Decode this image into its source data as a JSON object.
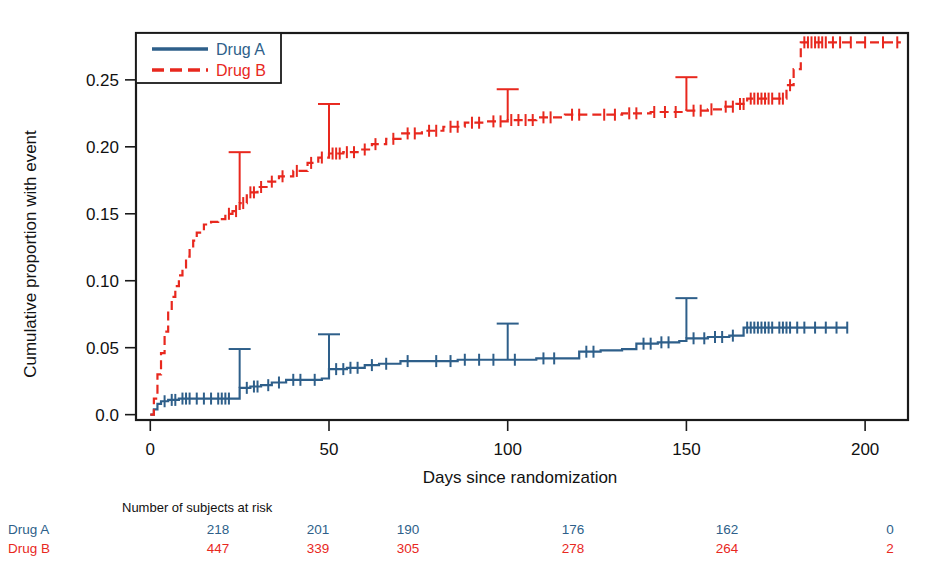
{
  "chart_data": {
    "type": "line",
    "title": "",
    "xlabel": "Days since randomization",
    "ylabel": "Cumulative proportion with event",
    "xlim": [
      -4,
      212
    ],
    "ylim": [
      -0.004,
      0.285
    ],
    "xticks": [
      0,
      50,
      100,
      150,
      200
    ],
    "xticklabels": [
      "0",
      "50",
      "100",
      "150",
      "200"
    ],
    "yticks": [
      0.0,
      0.05,
      0.1,
      0.15,
      0.2,
      0.25
    ],
    "yticklabels": [
      "0.0",
      "0.05",
      "0.10",
      "0.15",
      "0.20",
      "0.25"
    ],
    "grid": false,
    "legend_position": "top-left",
    "series": [
      {
        "name": "Drug A",
        "color": "#2e5f8a",
        "dash": "solid",
        "points": [
          [
            0,
            0.0
          ],
          [
            1,
            0.004
          ],
          [
            2,
            0.008
          ],
          [
            3,
            0.01
          ],
          [
            5,
            0.011
          ],
          [
            8,
            0.012
          ],
          [
            12,
            0.012
          ],
          [
            18,
            0.012
          ],
          [
            23,
            0.012
          ],
          [
            25,
            0.02
          ],
          [
            28,
            0.021
          ],
          [
            31,
            0.022
          ],
          [
            34,
            0.024
          ],
          [
            38,
            0.026
          ],
          [
            44,
            0.026
          ],
          [
            48,
            0.027
          ],
          [
            50,
            0.034
          ],
          [
            55,
            0.035
          ],
          [
            60,
            0.037
          ],
          [
            64,
            0.038
          ],
          [
            70,
            0.04
          ],
          [
            78,
            0.04
          ],
          [
            86,
            0.041
          ],
          [
            94,
            0.041
          ],
          [
            100,
            0.041
          ],
          [
            108,
            0.042
          ],
          [
            116,
            0.042
          ],
          [
            120,
            0.047
          ],
          [
            126,
            0.048
          ],
          [
            132,
            0.049
          ],
          [
            136,
            0.053
          ],
          [
            142,
            0.054
          ],
          [
            148,
            0.055
          ],
          [
            150,
            0.057
          ],
          [
            156,
            0.058
          ],
          [
            162,
            0.059
          ],
          [
            166,
            0.065
          ],
          [
            175,
            0.065
          ],
          [
            185,
            0.065
          ],
          [
            195,
            0.065
          ]
        ],
        "censor_times": [
          4,
          6,
          7,
          9,
          10,
          11,
          13,
          15,
          17,
          19,
          20,
          21,
          22,
          27,
          29,
          30,
          33,
          36,
          40,
          42,
          46,
          52,
          54,
          56,
          58,
          62,
          66,
          72,
          80,
          84,
          88,
          92,
          96,
          102,
          110,
          113,
          122,
          124,
          138,
          140,
          143,
          145,
          152,
          155,
          158,
          160,
          163,
          167,
          168,
          169,
          170,
          171,
          172,
          173,
          174,
          176,
          177,
          178,
          179,
          181,
          183,
          186,
          189,
          192,
          195
        ],
        "error_bars": [
          {
            "x": 25,
            "y": 0.02,
            "upper": 0.049
          },
          {
            "x": 50,
            "y": 0.034,
            "upper": 0.06
          },
          {
            "x": 100,
            "y": 0.041,
            "upper": 0.068
          },
          {
            "x": 150,
            "y": 0.057,
            "upper": 0.087
          }
        ]
      },
      {
        "name": "Drug B",
        "color": "#e8281e",
        "dash": "dashed",
        "points": [
          [
            0,
            0.0
          ],
          [
            1,
            0.012
          ],
          [
            2,
            0.03
          ],
          [
            3,
            0.046
          ],
          [
            4,
            0.062
          ],
          [
            5,
            0.078
          ],
          [
            6,
            0.088
          ],
          [
            7,
            0.096
          ],
          [
            8,
            0.104
          ],
          [
            9,
            0.11
          ],
          [
            10,
            0.118
          ],
          [
            11,
            0.124
          ],
          [
            12,
            0.13
          ],
          [
            13,
            0.136
          ],
          [
            15,
            0.142
          ],
          [
            17,
            0.144
          ],
          [
            19,
            0.146
          ],
          [
            21,
            0.15
          ],
          [
            23,
            0.152
          ],
          [
            25,
            0.158
          ],
          [
            27,
            0.166
          ],
          [
            30,
            0.17
          ],
          [
            33,
            0.174
          ],
          [
            36,
            0.178
          ],
          [
            40,
            0.182
          ],
          [
            44,
            0.188
          ],
          [
            47,
            0.192
          ],
          [
            50,
            0.195
          ],
          [
            54,
            0.196
          ],
          [
            58,
            0.198
          ],
          [
            62,
            0.202
          ],
          [
            66,
            0.206
          ],
          [
            70,
            0.21
          ],
          [
            76,
            0.212
          ],
          [
            82,
            0.215
          ],
          [
            88,
            0.218
          ],
          [
            94,
            0.219
          ],
          [
            100,
            0.22
          ],
          [
            108,
            0.222
          ],
          [
            116,
            0.224
          ],
          [
            124,
            0.224
          ],
          [
            132,
            0.225
          ],
          [
            140,
            0.226
          ],
          [
            150,
            0.227
          ],
          [
            156,
            0.228
          ],
          [
            160,
            0.23
          ],
          [
            164,
            0.232
          ],
          [
            167,
            0.236
          ],
          [
            175,
            0.236
          ],
          [
            178,
            0.246
          ],
          [
            180,
            0.258
          ],
          [
            182,
            0.278
          ],
          [
            190,
            0.278
          ],
          [
            200,
            0.278
          ],
          [
            210,
            0.278
          ]
        ],
        "censor_times": [
          22,
          24,
          26,
          28,
          29,
          31,
          34,
          37,
          41,
          45,
          48,
          51,
          52,
          53,
          55,
          57,
          60,
          63,
          68,
          72,
          74,
          78,
          80,
          84,
          86,
          90,
          92,
          96,
          98,
          101,
          103,
          105,
          107,
          110,
          112,
          118,
          120,
          127,
          130,
          134,
          136,
          141,
          144,
          147,
          152,
          154,
          157,
          161,
          163,
          165,
          166,
          168,
          169,
          170,
          171,
          172,
          173,
          174,
          176,
          177,
          179,
          183,
          184,
          185,
          186,
          187,
          188,
          189,
          191,
          193,
          196,
          200,
          205,
          209
        ],
        "error_bars": [
          {
            "x": 25,
            "y": 0.158,
            "upper": 0.196
          },
          {
            "x": 50,
            "y": 0.195,
            "upper": 0.232
          },
          {
            "x": 100,
            "y": 0.22,
            "upper": 0.243
          },
          {
            "x": 150,
            "y": 0.227,
            "upper": 0.252
          }
        ]
      }
    ]
  },
  "legend": {
    "entries": [
      {
        "label": "Drug A",
        "color": "#2e5f8a",
        "dash": "solid"
      },
      {
        "label": "Drug B",
        "color": "#e8281e",
        "dash": "dashed"
      }
    ]
  },
  "risk_table": {
    "header": "Number of subjects at risk",
    "times": [
      0,
      50,
      100,
      150,
      200
    ],
    "rows": [
      {
        "label": "Drug A",
        "color": "#2e5f8a",
        "values": [
          "218",
          "201",
          "190",
          "176",
          "162",
          "0"
        ]
      },
      {
        "label": "Drug B",
        "color": "#e8281e",
        "values": [
          "447",
          "339",
          "305",
          "278",
          "264",
          "2"
        ]
      }
    ],
    "value_x": [
      218,
      318,
      408,
      573,
      727,
      890
    ]
  }
}
